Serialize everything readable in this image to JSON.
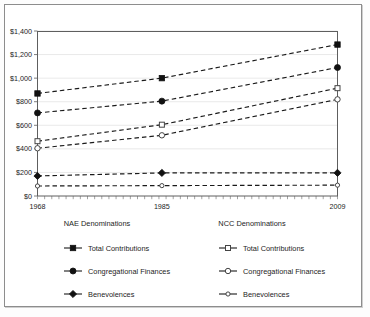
{
  "chart_data": {
    "type": "line",
    "title": "",
    "subtitle": "",
    "xlabel": "",
    "ylabel": "",
    "x": [
      1968,
      1985,
      2009
    ],
    "categories": [
      "1968",
      "1985",
      "2009"
    ],
    "xtick_labels": [
      "1968",
      "1985",
      "2009"
    ],
    "ytick_labels": [
      "$0",
      "$200",
      "$400",
      "$600",
      "$800",
      "$1,000",
      "$1,200",
      "$1,400"
    ],
    "ytick_values": [
      0,
      200,
      400,
      600,
      800,
      1000,
      1200,
      1400
    ],
    "ylim": [
      0,
      1400
    ],
    "xlim": [
      1968,
      2009
    ],
    "grid": true,
    "legend_position": "bottom",
    "series": [
      {
        "name": "NAE Total Contributions",
        "group": "NAE Denominations",
        "label": "Total Contributions",
        "marker": "filled-square",
        "values": [
          870,
          1000,
          1285
        ]
      },
      {
        "name": "NAE Congregational Finances",
        "group": "NAE Denominations",
        "label": "Congregational Finances",
        "marker": "filled-circle",
        "values": [
          705,
          805,
          1090
        ]
      },
      {
        "name": "NCC Total Contributions",
        "group": "NCC Denominations",
        "label": "Total Contributions",
        "marker": "hollow-square",
        "values": [
          465,
          605,
          915
        ]
      },
      {
        "name": "NCC Congregational Finances",
        "group": "NCC Denominations",
        "label": "Congregational Finances",
        "marker": "hollow-circle",
        "values": [
          405,
          515,
          820
        ]
      },
      {
        "name": "NAE Benevolences",
        "group": "NAE Denominations",
        "label": "Benevolences",
        "marker": "filled-diamond",
        "values": [
          170,
          196,
          196
        ]
      },
      {
        "name": "NCC Benevolences",
        "group": "NCC Denominations",
        "label": "Benevolences",
        "marker": "hollow-small-circle",
        "values": [
          85,
          88,
          92
        ]
      }
    ]
  },
  "legend": {
    "left": {
      "title": "NAE Denominations",
      "items": [
        {
          "label": "Total Contributions",
          "marker": "filled-square"
        },
        {
          "label": "Congregational Finances",
          "marker": "filled-circle"
        },
        {
          "label": "Benevolences",
          "marker": "filled-diamond"
        }
      ]
    },
    "right": {
      "title": "NCC Denominations",
      "items": [
        {
          "label": "Total Contributions",
          "marker": "hollow-square"
        },
        {
          "label": "Congregational Finances",
          "marker": "hollow-circle"
        },
        {
          "label": "Benevolences",
          "marker": "hollow-small-circle"
        }
      ]
    }
  },
  "colors": {
    "line": "#1a1a1a",
    "grid": "#e3e3e3",
    "axis": "#5e5e5e",
    "frame": "#8d8d8d",
    "background": "#ffffff"
  }
}
